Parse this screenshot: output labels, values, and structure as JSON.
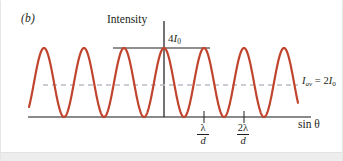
{
  "figure": {
    "panel_label": "(b)",
    "y_axis_title": "Intensity",
    "x_axis_title": "sin θ",
    "peak_label_coefficient": "4",
    "peak_label_symbol": "I",
    "peak_label_subscript": "0",
    "average_label_symbol": "I",
    "average_label_subscript": "av",
    "average_label_equals": " = 2",
    "average_label_value_symbol": "I",
    "average_label_value_subscript": "0",
    "tick_labels": [
      {
        "numerator": "λ",
        "denominator": "d"
      },
      {
        "numerator": "2λ",
        "denominator": "d"
      }
    ]
  },
  "colors": {
    "curve": "#c0442e",
    "baseline": "#8a8a8a",
    "dashed_average": "#b9bfc6",
    "axis": "#231f20",
    "text": "#231f20",
    "background": "#ffffff",
    "footer_band": "#ededed"
  },
  "chart_data": {
    "type": "line",
    "title": "",
    "subtitle": "",
    "xlabel": "sin θ",
    "ylabel": "Intensity",
    "xlim": [
      -3.375,
      3.35
    ],
    "ylim": [
      0,
      4
    ],
    "x_unit": "λ/d",
    "y_unit": "I₀",
    "grid": false,
    "legend": null,
    "function": "I = 4*I0*cos^2(pi * (sinθ) * d / λ)",
    "x_tick_values": [
      1,
      2
    ],
    "x_tick_labels": [
      "λ/d",
      "2λ/d"
    ],
    "y_reference_lines": [
      {
        "value": 4,
        "label": "4I₀",
        "style": "solid",
        "color": "#231f20"
      },
      {
        "value": 2,
        "label": "I_av = 2I₀",
        "style": "dashed",
        "color": "#b9bfc6"
      },
      {
        "value": 0,
        "label": "",
        "style": "solid",
        "color": "#8a8a8a"
      }
    ],
    "maxima_x": [
      -2,
      -1,
      0,
      1,
      2
    ],
    "maxima_y": [
      4,
      4,
      4,
      4,
      4
    ],
    "minima_x": [
      -2.5,
      -1.5,
      -0.5,
      0.5,
      1.5,
      2.5
    ],
    "minima_y": [
      0,
      0,
      0,
      0,
      0,
      0
    ],
    "sampled_x": [
      -3.375,
      -3.25,
      -3.125,
      -3,
      -2.875,
      -2.75,
      -2.625,
      -2.5,
      -2.375,
      -2.25,
      -2.125,
      -2,
      -1.875,
      -1.75,
      -1.625,
      -1.5,
      -1.375,
      -1.25,
      -1.125,
      -1,
      -0.875,
      -0.75,
      -0.625,
      -0.5,
      -0.375,
      -0.25,
      -0.125,
      0,
      0.125,
      0.25,
      0.375,
      0.5,
      0.625,
      0.75,
      0.875,
      1,
      1.125,
      1.25,
      1.375,
      1.5,
      1.625,
      1.75,
      1.875,
      2,
      2.125,
      2.25,
      2.375,
      2.5,
      2.625,
      2.75,
      2.875,
      3,
      3.125,
      3.25,
      3.35
    ],
    "sampled_y": [
      2.0,
      1.172,
      0.586,
      0.172,
      0.0,
      0.172,
      0.586,
      1.172,
      2.0,
      2.828,
      3.414,
      3.828,
      4.0,
      3.828,
      3.414,
      2.828,
      2.0,
      1.172,
      0.586,
      0.172,
      0.0,
      0.172,
      0.586,
      1.172,
      2.0,
      2.828,
      3.414,
      3.828,
      4.0,
      3.828,
      3.414,
      2.828,
      2.0,
      1.172,
      0.586,
      0.172,
      0.0,
      0.172,
      0.586,
      1.172,
      2.0,
      2.828,
      3.414,
      3.828,
      4.0,
      3.828,
      3.414,
      2.828,
      2.0,
      1.172,
      0.586,
      0.172,
      0.0,
      0.172,
      0.586
    ]
  }
}
